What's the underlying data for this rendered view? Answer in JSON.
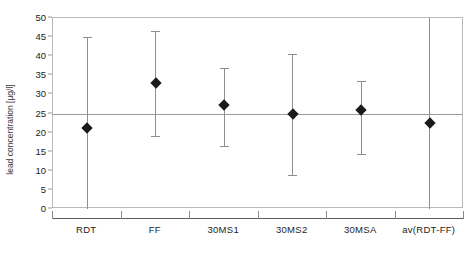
{
  "chart_data": {
    "type": "scatter",
    "title": "",
    "xlabel": "",
    "ylabel": "lead concentration [µg/l]",
    "ylim": [
      0,
      50
    ],
    "ytick_step": 5,
    "yticks": [
      0,
      5,
      10,
      15,
      20,
      25,
      30,
      35,
      40,
      45,
      50
    ],
    "grid": false,
    "legend": "none",
    "reference_line": {
      "value": 25,
      "label": "",
      "color": "#9a9a9a"
    },
    "categories": [
      "RDT",
      "FF",
      "30MS1",
      "30MS2",
      "30MSA",
      "av(RDT-FF)"
    ],
    "values": [
      21.2,
      33.0,
      27.2,
      25.0,
      26.0,
      22.6
    ],
    "error_low": [
      0.0,
      19.2,
      16.5,
      9.0,
      14.5,
      0.0
    ],
    "error_high": [
      45.0,
      46.5,
      37.0,
      40.5,
      33.5,
      50.0
    ],
    "marker": "filled-diamond",
    "marker_color": "#1a1a1a",
    "errorbar_color": "#8e8e8e",
    "series": [
      {
        "name": "lead concentration",
        "points": [
          {
            "category": "RDT",
            "value": 21.2,
            "low": 0.0,
            "high": 45.0
          },
          {
            "category": "FF",
            "value": 33.0,
            "low": 19.2,
            "high": 46.5
          },
          {
            "category": "30MS1",
            "value": 27.2,
            "low": 16.5,
            "high": 37.0
          },
          {
            "category": "30MS2",
            "value": 25.0,
            "low": 9.0,
            "high": 40.5
          },
          {
            "category": "30MSA",
            "value": 26.0,
            "low": 14.5,
            "high": 33.5
          },
          {
            "category": "av(RDT-FF)",
            "value": 22.6,
            "low": 0.0,
            "high": 50.0
          }
        ]
      }
    ],
    "ytick_labels": [
      "0",
      "5",
      "10",
      "15",
      "20",
      "25",
      "30",
      "35",
      "40",
      "45",
      "50"
    ],
    "colors": {
      "plot_border": "#b9b9b9",
      "axis": "#5a5a5a",
      "tick": "#8a8a8a",
      "text": "#1c1c1c",
      "background": "#ffffff"
    }
  }
}
